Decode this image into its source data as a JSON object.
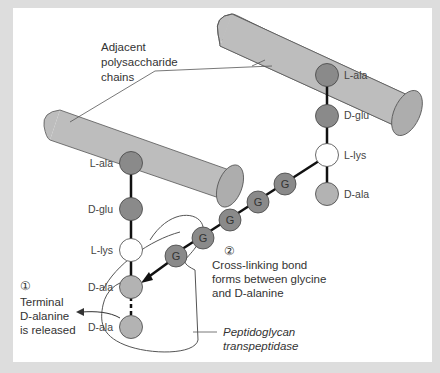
{
  "diagram": {
    "callouts": {
      "chains_label": [
        "Adjacent",
        "polysaccharide",
        "chains"
      ],
      "step1_number": "①",
      "step1_text": [
        "Terminal",
        "D-alanine",
        "is released"
      ],
      "step2_number": "②",
      "step2_text": [
        "Cross-linking bond",
        "forms between glycine",
        "and D-alanine"
      ],
      "enzyme_label": [
        "Peptidoglycan",
        "transpeptidase"
      ]
    },
    "left_chain": {
      "residues": [
        "L-ala",
        "D-glu",
        "L-lys",
        "D-ala",
        "D-ala"
      ]
    },
    "right_chain": {
      "residues": [
        "L-ala",
        "D-glu",
        "L-lys",
        "D-ala"
      ]
    },
    "glycine_bridge": {
      "residues": [
        "G",
        "G",
        "G",
        "G",
        "G"
      ]
    },
    "colors": {
      "background": "#dddddd",
      "panel": "#ffffff",
      "cylinder": "#bdbdbd",
      "dark_residue": "#8a8a8a",
      "light_residue": "#b3b3b3",
      "lys_residue": "#ffffff",
      "glycine": "#8a8a8a"
    }
  }
}
